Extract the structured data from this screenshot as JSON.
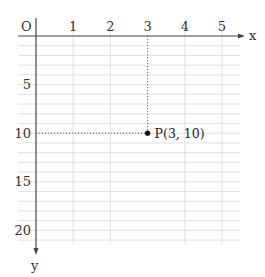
{
  "chart_data": {
    "type": "scatter",
    "title": "",
    "xlabel": "x",
    "ylabel": "y",
    "origin_label": "O",
    "x_ticks": [
      "1",
      "2",
      "3",
      "4",
      "5"
    ],
    "y_ticks": [
      "5",
      "10",
      "15",
      "20"
    ],
    "xlim": [
      0,
      5.5
    ],
    "ylim": [
      0,
      21
    ],
    "y_axis_direction": "down",
    "grid": true,
    "points": [
      {
        "label": "P(3, 10)",
        "x": 3,
        "y": 10
      }
    ],
    "guide_lines": "dotted projections from P to both axes",
    "colors": {
      "axis": "#444444",
      "grid": "#d9d9d9",
      "point": "#111111"
    }
  }
}
